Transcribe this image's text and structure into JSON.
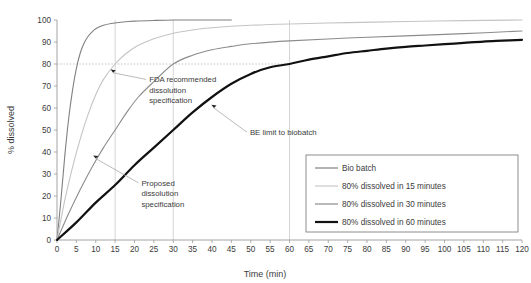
{
  "chart_data": {
    "type": "line",
    "title": "",
    "xlabel": "Time (min)",
    "ylabel": "% dissolved",
    "xlim": [
      0,
      120
    ],
    "ylim": [
      0,
      100
    ],
    "grid": true,
    "grid_note": "vertical gridlines at 15, 30 and 60 min; dotted horizontal reference line at 80% dissolved",
    "legend_position": "bottom-right",
    "xticks": [
      0,
      5,
      10,
      15,
      20,
      25,
      30,
      35,
      40,
      45,
      50,
      55,
      60,
      65,
      70,
      75,
      80,
      85,
      90,
      95,
      100,
      105,
      110,
      115,
      120
    ],
    "yticks": [
      0,
      10,
      20,
      30,
      40,
      50,
      60,
      70,
      80,
      90,
      100
    ],
    "reference_lines": {
      "horizontal": [
        {
          "value": 80,
          "style": "dotted",
          "extent_x": [
            0,
            60
          ]
        }
      ],
      "vertical": [
        {
          "value": 15,
          "style": "solid-light"
        },
        {
          "value": 30,
          "style": "solid-light"
        },
        {
          "value": 60,
          "style": "solid-light"
        }
      ]
    },
    "series": [
      {
        "name": "Bio batch",
        "color": "#808080",
        "width": 1.1,
        "points": [
          [
            0,
            0
          ],
          [
            1,
            18
          ],
          [
            2,
            38
          ],
          [
            3,
            55
          ],
          [
            4,
            68
          ],
          [
            5,
            78
          ],
          [
            6,
            85
          ],
          [
            7,
            89.5
          ],
          [
            8,
            92.5
          ],
          [
            9,
            94.5
          ],
          [
            10,
            96
          ],
          [
            12,
            97.6
          ],
          [
            14,
            98.4
          ],
          [
            17,
            99.1
          ],
          [
            20,
            99.5
          ],
          [
            25,
            99.8
          ],
          [
            30,
            100
          ],
          [
            35,
            100
          ],
          [
            40,
            100
          ],
          [
            45,
            100
          ]
        ]
      },
      {
        "name": "80% dissolved in 15 minutes",
        "color": "#c4c4c4",
        "width": 1.1,
        "points": [
          [
            0,
            0
          ],
          [
            2,
            18
          ],
          [
            4,
            33
          ],
          [
            6,
            46
          ],
          [
            8,
            57
          ],
          [
            10,
            66
          ],
          [
            12,
            73
          ],
          [
            15,
            80
          ],
          [
            18,
            85
          ],
          [
            21,
            88.5
          ],
          [
            25,
            91.5
          ],
          [
            30,
            94
          ],
          [
            35,
            95.5
          ],
          [
            40,
            96.5
          ],
          [
            50,
            97.6
          ],
          [
            60,
            98.2
          ],
          [
            75,
            98.8
          ],
          [
            90,
            99.3
          ],
          [
            105,
            99.7
          ],
          [
            120,
            100
          ]
        ]
      },
      {
        "name": "80% dissolved in 30 minutes",
        "color": "#8c8c8c",
        "width": 1.1,
        "points": [
          [
            0,
            0
          ],
          [
            3,
            12
          ],
          [
            6,
            23
          ],
          [
            9,
            33
          ],
          [
            12,
            42
          ],
          [
            15,
            50
          ],
          [
            18,
            58
          ],
          [
            21,
            65
          ],
          [
            25,
            72
          ],
          [
            30,
            80
          ],
          [
            35,
            84
          ],
          [
            40,
            86.5
          ],
          [
            45,
            88
          ],
          [
            50,
            89.2
          ],
          [
            60,
            90.5
          ],
          [
            75,
            91.8
          ],
          [
            90,
            92.8
          ],
          [
            105,
            93.8
          ],
          [
            120,
            95
          ]
        ]
      },
      {
        "name": "80% dissolved in 60 minutes",
        "color": "#111111",
        "width": 2.2,
        "points": [
          [
            0,
            0
          ],
          [
            5,
            8
          ],
          [
            10,
            17
          ],
          [
            15,
            25
          ],
          [
            20,
            34
          ],
          [
            25,
            42
          ],
          [
            30,
            50
          ],
          [
            35,
            58
          ],
          [
            40,
            65
          ],
          [
            45,
            71
          ],
          [
            50,
            75.5
          ],
          [
            55,
            78.5
          ],
          [
            60,
            80
          ],
          [
            65,
            82
          ],
          [
            70,
            83.5
          ],
          [
            75,
            85
          ],
          [
            80,
            86
          ],
          [
            85,
            87
          ],
          [
            90,
            87.8
          ],
          [
            95,
            88.4
          ],
          [
            100,
            89
          ],
          [
            105,
            89.6
          ],
          [
            110,
            90.2
          ],
          [
            115,
            90.6
          ],
          [
            120,
            91
          ]
        ]
      }
    ],
    "annotations": [
      {
        "text_lines": [
          "FDA recommended",
          "dissolution",
          "specification"
        ],
        "marker_point": [
          14.5,
          76
        ],
        "leader_to": [
          23,
          73
        ]
      },
      {
        "text_lines": [
          "Proposed",
          "dissolution",
          "specification"
        ],
        "marker_point": [
          10,
          37
        ],
        "leader_to": [
          21,
          26
        ]
      },
      {
        "text_lines": [
          "BE limit to biobatch"
        ],
        "marker_point": [
          40.5,
          60
        ],
        "leader_to": [
          49,
          49
        ]
      }
    ]
  },
  "legend": {
    "items": [
      {
        "label": "Bio batch",
        "color": "#808080",
        "width": 1.2
      },
      {
        "label": "80% dissolved in 15 minutes",
        "color": "#c4c4c4",
        "width": 1.1
      },
      {
        "label": "80% dissolved in 30 minutes",
        "color": "#8c8c8c",
        "width": 1.2
      },
      {
        "label": "80% dissolved in 60 minutes",
        "color": "#111111",
        "width": 2.2
      }
    ]
  },
  "axes": {
    "x_title": "Time (min)",
    "y_title": "% dissolved"
  }
}
